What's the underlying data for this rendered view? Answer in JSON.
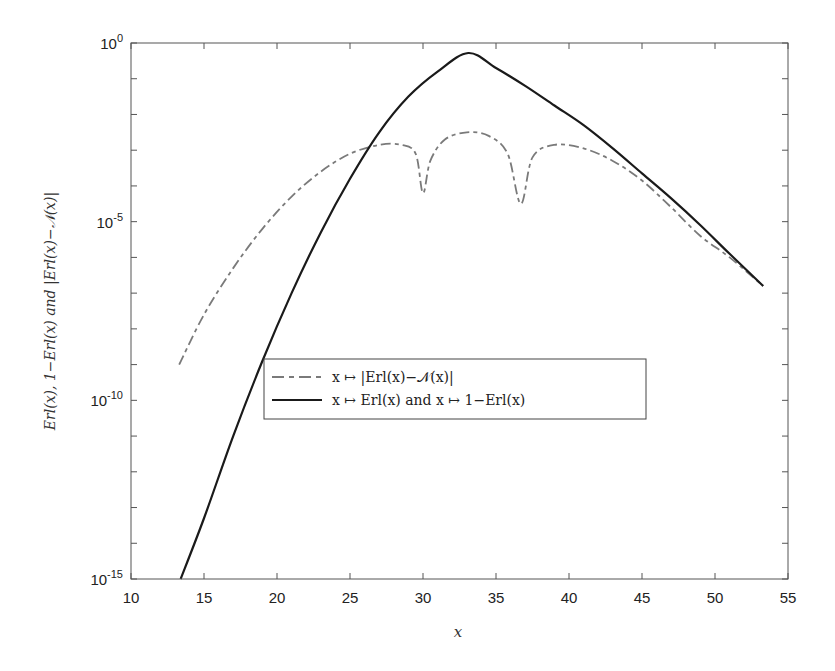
{
  "chart_data": {
    "type": "line",
    "title": "",
    "xlabel": "x",
    "ylabel": "Erl(x), 1−Erl(x) and |Erl(x)−𝒩(x)|",
    "xlim": [
      10,
      55
    ],
    "ylim_log10": [
      -15,
      0
    ],
    "yscale": "log",
    "grid": false,
    "x_ticks": [
      10,
      15,
      20,
      25,
      30,
      35,
      40,
      45,
      50,
      55
    ],
    "x_tick_labels": [
      "10",
      "15",
      "20",
      "25",
      "30",
      "35",
      "40",
      "45",
      "50",
      "55"
    ],
    "y_ticks_log10": [
      0,
      -5,
      -10,
      -15
    ],
    "y_tick_labels": [
      {
        "base": "10",
        "exp": "0"
      },
      {
        "base": "10",
        "exp": "-5"
      },
      {
        "base": "10",
        "exp": "-10"
      },
      {
        "base": "10",
        "exp": "-15"
      }
    ],
    "y_minor_ticks_log10": [
      -1,
      -2,
      -3,
      -4,
      -6,
      -7,
      -8,
      -9,
      -11,
      -12,
      -13,
      -14
    ],
    "legend_position": "center-left",
    "series": [
      {
        "name": "x ↦ |Erl(x)−𝒩(x)|",
        "style": "dash-dot",
        "color": "#7a7a7a",
        "x": [
          13.3,
          15,
          17,
          19,
          21,
          23,
          25,
          27,
          28.5,
          29.5,
          30.0,
          30.5,
          31.5,
          33,
          34.5,
          35.8,
          36.7,
          37.5,
          39,
          41,
          43,
          45,
          47,
          49,
          51,
          53.3
        ],
        "log10y": [
          -9.0,
          -7.6,
          -6.3,
          -5.2,
          -4.3,
          -3.6,
          -3.1,
          -2.85,
          -2.85,
          -3.1,
          -4.2,
          -3.3,
          -2.7,
          -2.5,
          -2.6,
          -3.1,
          -4.5,
          -3.2,
          -2.85,
          -2.95,
          -3.3,
          -3.85,
          -4.6,
          -5.4,
          -6.0,
          -6.8
        ]
      },
      {
        "name": "x ↦ Erl(x) and x ↦ 1−Erl(x)",
        "style": "solid",
        "color": "#1a1a1a",
        "x": [
          13.4,
          15,
          17,
          19,
          21,
          23,
          25,
          27,
          29,
          31,
          33.1,
          35,
          37,
          39,
          41,
          43,
          45,
          47,
          49,
          51,
          53.3
        ],
        "log10y": [
          -15.0,
          -13.3,
          -11.0,
          -8.9,
          -7.0,
          -5.3,
          -3.8,
          -2.5,
          -1.5,
          -0.8,
          -0.28,
          -0.7,
          -1.2,
          -1.75,
          -2.3,
          -2.95,
          -3.65,
          -4.35,
          -5.1,
          -5.9,
          -6.8
        ]
      }
    ]
  }
}
